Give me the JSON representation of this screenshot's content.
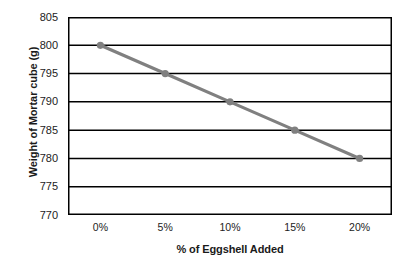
{
  "chart_data": {
    "type": "line",
    "title": "",
    "xlabel": "% of Eggshell Added",
    "ylabel": "Weight of Mortar cube (g)",
    "categories": [
      "0%",
      "5%",
      "10%",
      "15%",
      "20%"
    ],
    "values": [
      800,
      795,
      790,
      785,
      780
    ],
    "series": [
      {
        "name": "Weight of Mortar cube",
        "values": [
          800,
          795,
          790,
          785,
          780
        ]
      }
    ],
    "ylim": [
      770,
      805
    ],
    "ytick_labels": [
      "805",
      "800",
      "795",
      "790",
      "785",
      "780",
      "775",
      "770"
    ],
    "ytick_values": [
      805,
      800,
      795,
      790,
      785,
      780,
      775,
      770
    ],
    "ytick_step": 5,
    "grid": "horizontal",
    "legend": "none",
    "colors": {
      "line": "#808080",
      "marker": "#808080",
      "gridline": "#000000",
      "border": "#000000",
      "plot_background": "#ffffff",
      "text": "#222222"
    }
  },
  "axes": {
    "y_title": "Weight of Mortar cube (g)",
    "x_title": "% of Eggshell Added",
    "y_ticks": [
      "805",
      "800",
      "795",
      "790",
      "785",
      "780",
      "775",
      "770"
    ],
    "x_ticks": [
      "0%",
      "5%",
      "10%",
      "15%",
      "20%"
    ]
  }
}
